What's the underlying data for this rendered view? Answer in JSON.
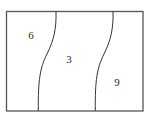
{
  "diagram": {
    "type": "partitioned-rectangle",
    "stroke_color": "#555555",
    "curve_color": "#333333",
    "text_color": "#2b2b2b",
    "background": "#ffffff",
    "frame": {
      "x": 6.5,
      "y": 11.5,
      "width": 136.5,
      "height": 99.5
    },
    "regions": [
      {
        "id": "left",
        "label": "6",
        "x": 31,
        "y": 35
      },
      {
        "id": "middle",
        "label": "3",
        "x": 69,
        "y": 59
      },
      {
        "id": "right",
        "label": "9",
        "x": 117,
        "y": 82
      }
    ]
  }
}
